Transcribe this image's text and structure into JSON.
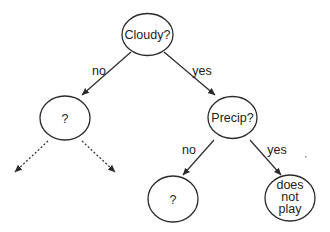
{
  "diagram": {
    "type": "decision-tree",
    "nodes": [
      {
        "id": "cloudy",
        "label": "Cloudy?",
        "cx": 147.5,
        "cy": 34.5,
        "rx": 25.5,
        "ry": 21
      },
      {
        "id": "left-unknown",
        "label": "?",
        "cx": 65,
        "cy": 118,
        "rx": 25,
        "ry": 22
      },
      {
        "id": "precip",
        "label": "Precip?",
        "cx": 232.5,
        "cy": 117.5,
        "rx": 24.5,
        "ry": 21
      },
      {
        "id": "bottom-unknown",
        "label": "?",
        "cx": 173,
        "cy": 199,
        "rx": 25,
        "ry": 23
      },
      {
        "id": "does-not-play",
        "label_lines": [
          "does",
          "not",
          "play"
        ],
        "cx": 290,
        "cy": 198,
        "rx": 25,
        "ry": 23
      }
    ],
    "edges": [
      {
        "from": "cloudy",
        "to": "left-unknown",
        "label": "no",
        "style": "solid"
      },
      {
        "from": "cloudy",
        "to": "precip",
        "label": "yes",
        "style": "solid"
      },
      {
        "from": "left-unknown",
        "to": "left-child",
        "label": "",
        "style": "dotted"
      },
      {
        "from": "left-unknown",
        "to": "right-child",
        "label": "",
        "style": "dotted"
      },
      {
        "from": "precip",
        "to": "bottom-unknown",
        "label": "no",
        "style": "solid"
      },
      {
        "from": "precip",
        "to": "does-not-play",
        "label": "yes",
        "style": "solid"
      }
    ],
    "colors": {
      "stroke": "#2a2a2a",
      "text": "#222222",
      "background": "#ffffff"
    }
  }
}
